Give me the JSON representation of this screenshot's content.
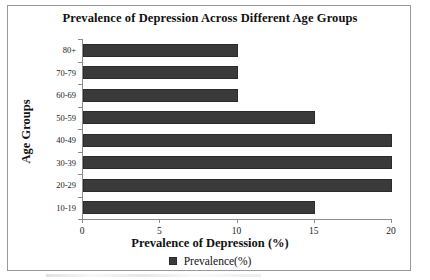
{
  "chart_data": {
    "type": "bar",
    "orientation": "horizontal",
    "title": "Prevalence of Depression Across Different Age Groups",
    "xlabel": "Prevalence of Depression (%)",
    "ylabel": "Age Groups",
    "categories": [
      "80+",
      "70-79",
      "60-69",
      "50-59",
      "40-49",
      "30-39",
      "20-29",
      "10-19"
    ],
    "values": [
      10,
      10,
      10,
      15,
      20,
      20,
      20,
      15
    ],
    "series": [
      {
        "name": "Prevalence(%)",
        "values": [
          10,
          10,
          10,
          15,
          20,
          20,
          20,
          15
        ],
        "color": "#3a3a3a"
      }
    ],
    "xlim": [
      0,
      20
    ],
    "xticks": [
      0,
      5,
      10,
      15,
      20
    ],
    "xtick_labels": [
      "0",
      "5",
      "10",
      "15",
      "20"
    ],
    "grid": false,
    "legend": {
      "position": "bottom",
      "entries": [
        {
          "label": "Prevalence(%)",
          "color": "#3a3a3a"
        }
      ]
    }
  },
  "style": {
    "bar_color": "#3a3a3a",
    "axis_color": "#8c8c8c",
    "frame_color": "#9a9a9a",
    "text_color": "#111111",
    "background": "#ffffff"
  }
}
